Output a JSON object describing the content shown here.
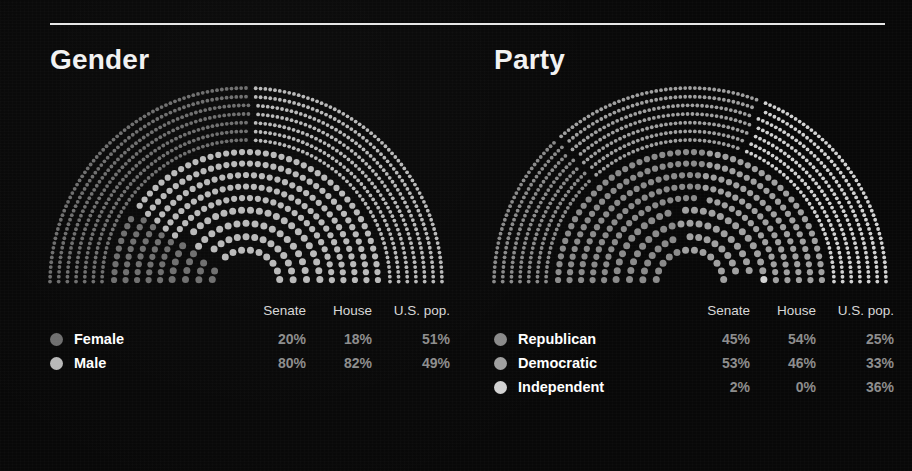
{
  "background_color": "#080808",
  "rule_color": "#e8e8e8",
  "panels": [
    {
      "id": "gender",
      "title": "Gender",
      "columns": [
        "Senate",
        "House",
        "U.S. pop."
      ],
      "label_header": "",
      "rows": [
        {
          "label": "Female",
          "color": "#6e6e6e",
          "senate": "20%",
          "house": "18%",
          "us_pop": "51%"
        },
        {
          "label": "Male",
          "color": "#b9b9b9",
          "senate": "80%",
          "house": "82%",
          "us_pop": "49%"
        }
      ]
    },
    {
      "id": "party",
      "title": "Party",
      "columns": [
        "Senate",
        "House",
        "U.S. pop."
      ],
      "label_header": "",
      "rows": [
        {
          "label": "Republican",
          "color": "#8a8a8a",
          "senate": "45%",
          "house": "54%",
          "us_pop": "25%"
        },
        {
          "label": "Democratic",
          "color": "#a0a0a0",
          "senate": "53%",
          "house": "46%",
          "us_pop": "33%"
        },
        {
          "label": "Independent",
          "color": "#d2d2d2",
          "senate": "2%",
          "house": "0%",
          "us_pop": "36%"
        }
      ]
    }
  ],
  "chart_data": [
    {
      "type": "pie",
      "title": "Gender",
      "subtitle": "",
      "notes": "Three concentric semicircular dot arcs. Outer arc = U.S. pop., middle arc = House, inner arc = Senate.",
      "categories": [
        "Female",
        "Male"
      ],
      "series": [
        {
          "name": "Senate",
          "ring": "inner",
          "values": [
            20,
            80
          ],
          "unit": "%"
        },
        {
          "name": "House",
          "ring": "middle",
          "values": [
            18,
            82
          ],
          "unit": "%"
        },
        {
          "name": "U.S. pop.",
          "ring": "outer",
          "values": [
            51,
            49
          ],
          "unit": "%"
        }
      ],
      "colors": [
        "#6e6e6e",
        "#b9b9b9"
      ],
      "legend_position": "bottom",
      "grid": false
    },
    {
      "type": "pie",
      "title": "Party",
      "subtitle": "",
      "notes": "Three concentric semicircular dot arcs. Outer arc = U.S. pop., middle arc = House, inner arc = Senate.",
      "categories": [
        "Republican",
        "Democratic",
        "Independent"
      ],
      "series": [
        {
          "name": "Senate",
          "ring": "inner",
          "values": [
            45,
            53,
            2
          ],
          "unit": "%"
        },
        {
          "name": "House",
          "ring": "middle",
          "values": [
            54,
            46,
            0
          ],
          "unit": "%"
        },
        {
          "name": "U.S. pop.",
          "ring": "outer",
          "values": [
            25,
            33,
            36
          ],
          "unit": "%"
        }
      ],
      "colors": [
        "#8a8a8a",
        "#a0a0a0",
        "#d2d2d2"
      ],
      "legend_position": "bottom",
      "grid": false
    }
  ]
}
